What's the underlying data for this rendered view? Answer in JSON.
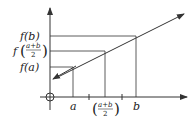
{
  "diagram": {
    "y_labels": {
      "fb": "f(b)",
      "fmid_f": "f",
      "fmid_num": "a+b",
      "fmid_den": "2",
      "fa": "f(a)"
    },
    "x_labels": {
      "a": "a",
      "mid_num": "a+b",
      "mid_den": "2",
      "b": "b"
    },
    "colors": {
      "stroke": "#333333",
      "background": "#ffffff"
    }
  }
}
